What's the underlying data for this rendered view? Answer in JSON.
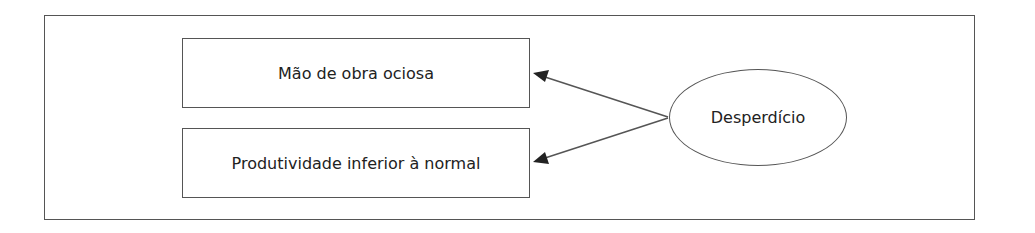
{
  "diagram": {
    "source_node": {
      "label": "Desperdício"
    },
    "target_nodes": [
      {
        "label": "Mão de obra ociosa"
      },
      {
        "label": "Produtividade inferior à normal"
      }
    ],
    "edges": [
      {
        "from": "Desperdício",
        "to": "Mão de obra ociosa"
      },
      {
        "from": "Desperdício",
        "to": "Produtividade inferior à normal"
      }
    ],
    "colors": {
      "stroke": "#555555",
      "text": "#222222",
      "background": "#ffffff"
    }
  }
}
